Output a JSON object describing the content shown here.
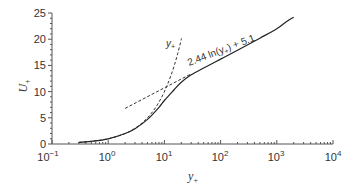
{
  "chart_data": {
    "type": "line",
    "title": "",
    "xlabel": "y+",
    "ylabel": "U+",
    "xscale": "log",
    "xlim": [
      0.1,
      10000
    ],
    "ylim": [
      0,
      25
    ],
    "grid": false,
    "x_ticks": [
      "10^-1",
      "10^0",
      "10^1",
      "10^2",
      "10^3",
      "10^4"
    ],
    "y_ticks": [
      0,
      5,
      10,
      15,
      20,
      25
    ],
    "series": [
      {
        "name": "velocity profile",
        "style": "solid",
        "x": [
          0.3,
          0.5,
          1,
          2,
          3,
          5,
          8,
          10,
          15,
          20,
          30,
          50,
          100,
          200,
          500,
          1000,
          1500,
          2000
        ],
        "y": [
          0.3,
          0.5,
          1.0,
          2.0,
          2.9,
          4.7,
          7.0,
          8.3,
          10.4,
          11.8,
          13.2,
          14.5,
          16.2,
          17.9,
          20.2,
          22.0,
          23.4,
          24.2
        ]
      },
      {
        "name": "viscous sublayer",
        "label": "y+",
        "style": "dashed",
        "x": [
          0.3,
          1,
          3,
          10,
          15,
          20
        ],
        "y": [
          0.3,
          1,
          3,
          10,
          15,
          20
        ]
      },
      {
        "name": "log law",
        "label": "2.44 ln(y+) + 5.1",
        "style": "dashed",
        "x": [
          2,
          5,
          10,
          20,
          30
        ],
        "y": [
          6.8,
          9.0,
          10.7,
          12.4,
          13.4
        ]
      }
    ],
    "annotations": [
      {
        "text": "y+",
        "near": "viscous sublayer line top"
      },
      {
        "text": "2.44 ln(y+) + 5.1",
        "near": "log-law region, rotated along curve"
      }
    ]
  },
  "labels": {
    "x_axis": "y",
    "x_axis_sub": "+",
    "y_axis": "U",
    "y_axis_sub": "+",
    "annot_viscous": "y",
    "annot_viscous_sub": "+",
    "annot_loglaw_pre": "2.44 ln(y",
    "annot_loglaw_sub": "+",
    "annot_loglaw_post": ") + 5.1"
  },
  "ticks": {
    "x": [
      "10",
      "10",
      "10",
      "10",
      "10",
      "10"
    ],
    "x_exp": [
      "−1",
      "0",
      "1",
      "2",
      "3",
      "4"
    ],
    "y": [
      "0",
      "5",
      "10",
      "15",
      "20",
      "25"
    ]
  },
  "colors": {
    "axis": "#555555",
    "curve": "#222222",
    "dashed": "#333333",
    "text": "#333333"
  }
}
